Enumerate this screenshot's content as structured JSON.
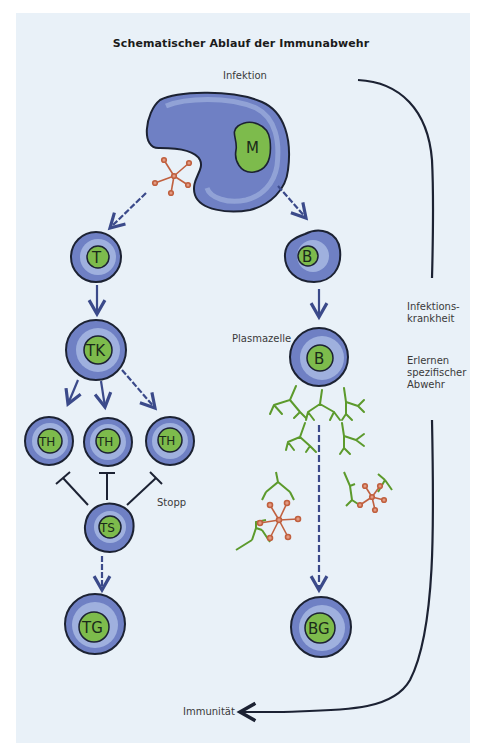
{
  "title": "Schematischer Ablauf der Immunabwehr",
  "labels": {
    "infektion": "Infektion",
    "plasmazelle": "Plasmazelle",
    "stopp": "Stopp",
    "infektionskrankheit": "Infektions-\nkrankheit",
    "erlernen": "Erlernen\nspezifischer\nAbwehr",
    "immunitaet": "Immunität"
  },
  "cells": {
    "macrophage": "M",
    "t_cell": "T",
    "b_cell": "B",
    "t_killer": "TK",
    "t_helper_1": "TH",
    "t_helper_2": "TH",
    "t_helper_3": "TH",
    "t_suppressor": "TS",
    "t_memory": "TG",
    "plasma_b": "B",
    "b_memory": "BG"
  },
  "colors": {
    "background": "#e9f1f8",
    "cell_outer": "#6f80c4",
    "cell_inner_ring": "#9fb0de",
    "nucleus": "#7dbb4c",
    "outline": "#1c2233",
    "arrow": "#3b4a8a",
    "antibody": "#5c9a2c",
    "antigen": "#d0745a"
  }
}
